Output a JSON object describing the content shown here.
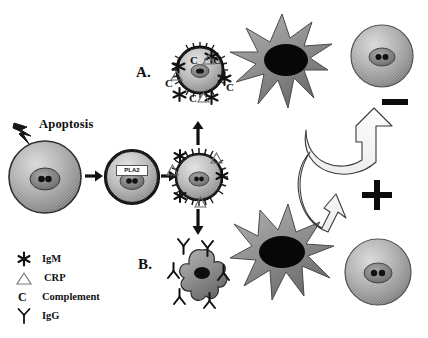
{
  "figure": {
    "background_color": "#ffffff",
    "type": "biological-pathway-diagram"
  },
  "labels": {
    "apoptosis": "Apoptosis",
    "pla2": "PLA2",
    "panel_a": "A.",
    "panel_b": "B.",
    "minus_sign": "−",
    "plus_sign": "+"
  },
  "legend": {
    "items": [
      {
        "symbol": "igm-star-icon",
        "label": "IgM"
      },
      {
        "symbol": "crp-triangle-icon",
        "label": "CRP"
      },
      {
        "symbol": "complement-c-icon",
        "label": "Complement"
      },
      {
        "symbol": "igg-y-icon",
        "label": "IgG"
      }
    ]
  },
  "colors": {
    "cell_body": "#9a9a9a",
    "cell_rim": "#1a1a1a",
    "nucleus": "#6f6f6f",
    "macrophage": "#8c8c8c",
    "macrophage_nucleus": "#0a0a0a",
    "arrow_outline": "#3b3b3b",
    "ink": "#111111"
  },
  "flow": {
    "steps": [
      {
        "name": "healthy-cell",
        "note": "viable cell struck by injury stimulus"
      },
      {
        "name": "apoptotic-cell-pla2",
        "note": "shrinking cell expressing PLA2"
      },
      {
        "name": "opsonized-apoptotic-cell",
        "note": "cell bound by IgM, CRP, complement"
      },
      {
        "name": "panel-a-uptake",
        "note": "early apoptotic cell engulfed by macrophage"
      },
      {
        "name": "panel-b-uptake",
        "note": "apoptotic bodies with IgG engulfed by macrophage"
      }
    ],
    "outcomes": [
      {
        "panel": "A.",
        "sign": "−",
        "meaning": "non-inflammatory clearance"
      },
      {
        "panel": "B.",
        "sign": "+",
        "meaning": "inflammatory response"
      }
    ]
  },
  "opsonins": {
    "panel_a_cell": [
      "IgM",
      "IgM",
      "IgM",
      "IgM",
      "IgM",
      "C",
      "C",
      "C",
      "C",
      "C",
      "CRP",
      "CRP",
      "CRP"
    ],
    "center_cell": [
      "IgM",
      "IgM",
      "IgM",
      "CRP",
      "CRP",
      "CRP"
    ],
    "panel_b_bodies": [
      "IgG",
      "IgG",
      "IgG",
      "IgG",
      "IgG",
      "IgG"
    ]
  }
}
